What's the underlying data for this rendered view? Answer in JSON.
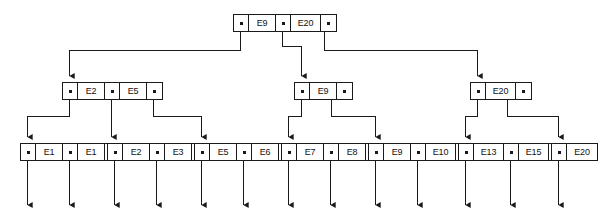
{
  "diagram": {
    "colors": {
      "line": "#1a1a1a",
      "node_fill": "#ffffff",
      "background": "#ffffff"
    },
    "levels": [
      {
        "name": "root",
        "nodes": [
          {
            "id": "root",
            "x": 233,
            "y": 14,
            "cells": [
              {
                "type": "pointer"
              },
              {
                "type": "key",
                "label": "E9"
              },
              {
                "type": "pointer"
              },
              {
                "type": "key",
                "label": "E20"
              },
              {
                "type": "pointer"
              }
            ]
          }
        ]
      },
      {
        "name": "internal",
        "nodes": [
          {
            "id": "internal-left",
            "x": 62,
            "y": 82,
            "cells": [
              {
                "type": "pointer"
              },
              {
                "type": "key",
                "label": "E2"
              },
              {
                "type": "pointer"
              },
              {
                "type": "key",
                "label": "E5"
              },
              {
                "type": "pointer"
              }
            ]
          },
          {
            "id": "internal-middle",
            "x": 294,
            "y": 82,
            "cells": [
              {
                "type": "pointer"
              },
              {
                "type": "key",
                "label": "E9"
              },
              {
                "type": "pointer"
              }
            ]
          },
          {
            "id": "internal-right",
            "x": 470,
            "y": 82,
            "cells": [
              {
                "type": "pointer"
              },
              {
                "type": "key",
                "label": "E20"
              },
              {
                "type": "pointer"
              }
            ]
          }
        ]
      },
      {
        "name": "leaf",
        "nodes": [
          {
            "id": "leaf-1",
            "x": 20,
            "y": 143,
            "cells": [
              {
                "type": "pointer"
              },
              {
                "type": "key",
                "label": "E1"
              },
              {
                "type": "pointer"
              },
              {
                "type": "key",
                "label": "E1"
              },
              {
                "type": "pointer"
              }
            ]
          },
          {
            "id": "leaf-2",
            "x": 107,
            "y": 143,
            "cells": [
              {
                "type": "pointer"
              },
              {
                "type": "key",
                "label": "E2"
              },
              {
                "type": "pointer"
              },
              {
                "type": "key",
                "label": "E3"
              },
              {
                "type": "pointer"
              }
            ]
          },
          {
            "id": "leaf-3",
            "x": 194,
            "y": 143,
            "cells": [
              {
                "type": "pointer"
              },
              {
                "type": "key",
                "label": "E5"
              },
              {
                "type": "pointer"
              },
              {
                "type": "key",
                "label": "E6"
              },
              {
                "type": "pointer"
              }
            ]
          },
          {
            "id": "leaf-4",
            "x": 281,
            "y": 143,
            "cells": [
              {
                "type": "pointer"
              },
              {
                "type": "key",
                "label": "E7"
              },
              {
                "type": "pointer"
              },
              {
                "type": "key",
                "label": "E8"
              },
              {
                "type": "pointer"
              }
            ]
          },
          {
            "id": "leaf-5",
            "x": 368,
            "y": 143,
            "cells": [
              {
                "type": "pointer"
              },
              {
                "type": "key",
                "label": "E9"
              },
              {
                "type": "pointer"
              },
              {
                "type": "key",
                "label": "E10"
              },
              {
                "type": "pointer"
              }
            ]
          },
          {
            "id": "leaf-6",
            "x": 458,
            "y": 143,
            "cells": [
              {
                "type": "pointer"
              },
              {
                "type": "key",
                "label": "E13"
              },
              {
                "type": "pointer"
              },
              {
                "type": "key",
                "label": "E15"
              },
              {
                "type": "pointer"
              }
            ]
          },
          {
            "id": "leaf-7",
            "x": 551,
            "y": 143,
            "cells": [
              {
                "type": "pointer"
              },
              {
                "type": "key",
                "label": "E20"
              }
            ]
          }
        ]
      }
    ]
  }
}
